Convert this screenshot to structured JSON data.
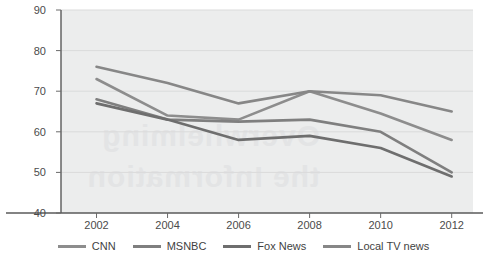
{
  "chart_data": {
    "type": "line",
    "title": "",
    "xlabel": "",
    "ylabel": "",
    "x": [
      2002,
      2004,
      2006,
      2008,
      2010,
      2012
    ],
    "xtick_labels": [
      "2002",
      "2004",
      "2006",
      "2008",
      "2010",
      "2012"
    ],
    "ytick_labels": [
      "90",
      "80",
      "70",
      "60",
      "50",
      "40"
    ],
    "yticks": [
      90,
      80,
      70,
      60,
      50,
      40
    ],
    "ylim": [
      40,
      90
    ],
    "xlim": [
      2001,
      2012.6
    ],
    "grid": true,
    "legend_position": "bottom",
    "plot_background": "#eceded",
    "series": [
      {
        "name": "CNN",
        "color": "#8d8d8d",
        "values": [
          73,
          64,
          63,
          70,
          64.5,
          58
        ]
      },
      {
        "name": "MSNBC",
        "color": "#7f7f7f",
        "values": [
          68,
          63,
          62.5,
          63,
          60,
          50
        ]
      },
      {
        "name": "Fox News",
        "color": "#6e6e6e",
        "values": [
          67,
          63,
          58,
          59,
          56,
          49
        ]
      },
      {
        "name": "Local TV news",
        "color": "#878787",
        "values": [
          76,
          72,
          67,
          70,
          69,
          65
        ]
      }
    ]
  },
  "watermark": {
    "text": "Overwhelming\nthe Information"
  },
  "legend": {
    "items": [
      {
        "label": "CNN"
      },
      {
        "label": "MSNBC"
      },
      {
        "label": "Fox News"
      },
      {
        "label": "Local TV news"
      }
    ]
  }
}
